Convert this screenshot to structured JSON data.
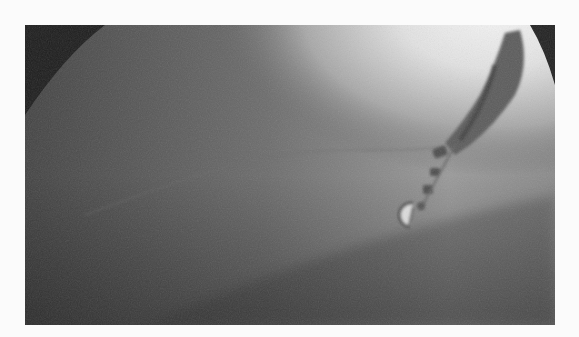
{
  "image": {
    "kind": "fluoroscopy",
    "description": "Grayscale X-ray fluoroscopy frame showing catheters and a circular device",
    "colors": {
      "page_background": "#fbfbfb",
      "dark_corner": "#1e1e1e",
      "tissue_dark": "#4a4a4a",
      "tissue_mid": "#8a8a8a",
      "bright_region": "#f2f2f2",
      "catheter": "#555555"
    }
  }
}
